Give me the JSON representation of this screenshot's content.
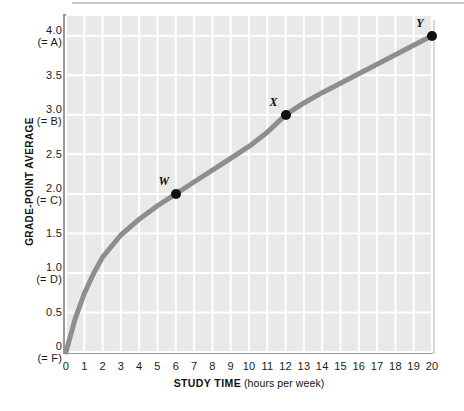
{
  "chart_data": {
    "type": "line",
    "title": "",
    "xlabel_bold": "STUDY TIME",
    "xlabel_unit": "(hours per week)",
    "ylabel": "GRADE-POINT AVERAGE",
    "xlim": [
      0,
      20
    ],
    "ylim": [
      0,
      4.25
    ],
    "grid": true,
    "legend_position": "none",
    "x_ticks": [
      "0",
      "1",
      "2",
      "3",
      "4",
      "5",
      "6",
      "7",
      "8",
      "9",
      "10",
      "11",
      "12",
      "13",
      "14",
      "15",
      "16",
      "17",
      "18",
      "19",
      "20"
    ],
    "y_ticks": [
      {
        "value": "4.0",
        "grade": "(= A)"
      },
      {
        "value": "3.5",
        "grade": ""
      },
      {
        "value": "3.0",
        "grade": "(= B)"
      },
      {
        "value": "2.5",
        "grade": ""
      },
      {
        "value": "2.0",
        "grade": "(= C)"
      },
      {
        "value": "1.5",
        "grade": ""
      },
      {
        "value": "1.0",
        "grade": "(= D)"
      },
      {
        "value": "0.5",
        "grade": ""
      },
      {
        "value": "0",
        "grade": "(= F)"
      }
    ],
    "series": [
      {
        "name": "GPA vs study time",
        "color": "#8e8e8e",
        "x": [
          0,
          0.5,
          1,
          1.5,
          2,
          3,
          4,
          5,
          6,
          7,
          8,
          9,
          10,
          11,
          12,
          13,
          14,
          15,
          16,
          17,
          18,
          19,
          20
        ],
        "y": [
          0,
          0.42,
          0.74,
          0.99,
          1.2,
          1.48,
          1.68,
          1.85,
          2.0,
          2.15,
          2.3,
          2.45,
          2.6,
          2.78,
          3.0,
          3.15,
          3.28,
          3.4,
          3.52,
          3.64,
          3.76,
          3.88,
          4.0
        ]
      }
    ],
    "annotated_points": [
      {
        "label": "W",
        "x": 6,
        "y": 2.0
      },
      {
        "label": "X",
        "x": 12,
        "y": 3.0
      },
      {
        "label": "Y",
        "x": 20,
        "y": 4.0
      }
    ],
    "colors": {
      "plot_background": "#e9e9e9",
      "gridline": "#ffffff",
      "axis_line": "#9a9a9a",
      "curve": "#8e8e8e",
      "point": "#111111",
      "text": "#111111"
    }
  }
}
